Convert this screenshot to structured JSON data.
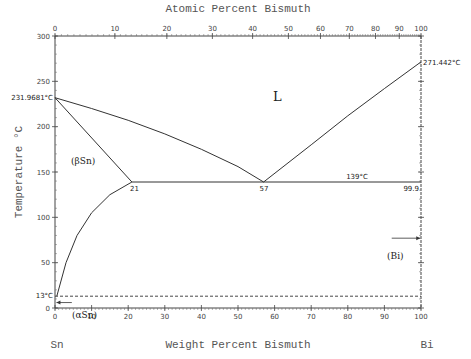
{
  "chart_data": {
    "type": "line",
    "title": "Atomic Percent Bismuth",
    "xlabel": "Weight Percent Bismuth",
    "ylabel": "Temperature °C",
    "xlim": [
      0,
      100
    ],
    "ylim": [
      0,
      300
    ],
    "x_ticks": [
      0,
      10,
      20,
      30,
      40,
      50,
      60,
      70,
      80,
      90,
      100
    ],
    "y_ticks": [
      0,
      50,
      100,
      150,
      200,
      250,
      300
    ],
    "top_axis_ticks": [
      0,
      10,
      20,
      30,
      40,
      50,
      60,
      70,
      80,
      90,
      100
    ],
    "grid": false,
    "component_left": "Sn",
    "component_right": "Bi",
    "series": [
      {
        "name": "liquidus Sn side",
        "x": [
          0,
          10,
          20,
          30,
          40,
          50,
          57
        ],
        "y": [
          231.9681,
          220,
          207,
          192,
          175,
          156,
          139
        ]
      },
      {
        "name": "liquidus Bi side",
        "x": [
          57,
          70,
          80,
          90,
          100
        ],
        "y": [
          139,
          180,
          212,
          242,
          271.442
        ]
      },
      {
        "name": "solidus (βSn)",
        "x": [
          0,
          21
        ],
        "y": [
          231.9681,
          139
        ]
      },
      {
        "name": "solvus (βSn)",
        "x": [
          0.5,
          3,
          6,
          10,
          15,
          21
        ],
        "y": [
          13,
          50,
          80,
          105,
          125,
          139
        ]
      },
      {
        "name": "eutectic line",
        "x": [
          21,
          99.9
        ],
        "y": [
          139,
          139
        ]
      },
      {
        "name": "αSn/βSn transition (dashed)",
        "x": [
          0,
          100
        ],
        "y": [
          13,
          13
        ]
      }
    ],
    "annotations": [
      {
        "text": "231.9681°C",
        "x": 0,
        "y": 231.9681
      },
      {
        "text": "271.442°C",
        "x": 100,
        "y": 271.442
      },
      {
        "text": "L",
        "x": 48,
        "y": 220
      },
      {
        "text": "(βSn)",
        "x": 7,
        "y": 140
      },
      {
        "text": "21",
        "x": 21,
        "y": 139
      },
      {
        "text": "57",
        "x": 57,
        "y": 139
      },
      {
        "text": "139°C",
        "x": 82,
        "y": 139
      },
      {
        "text": "99.9",
        "x": 99.9,
        "y": 139
      },
      {
        "text": "(Bi)",
        "x": 97,
        "y": 77
      },
      {
        "text": "13°C",
        "x": 0,
        "y": 13
      },
      {
        "text": "(αSn)",
        "x": 5,
        "y": 5
      }
    ]
  },
  "labels": {
    "top_title": "Atomic Percent Bismuth",
    "bottom_title": "Weight Percent Bismuth",
    "y_title": "Temperature °C",
    "left_elem": "Sn",
    "right_elem": "Bi",
    "L": "L",
    "beta_sn": "(βSn)",
    "alpha_sn": "(αSn)",
    "bi_phase": "(Bi)",
    "sn_melt": "231.9681°C",
    "bi_melt": "271.442°C",
    "eut_left": "21",
    "eut_mid": "57",
    "eut_temp": "139°C",
    "eut_right": "99.9",
    "trans_temp": "13°C"
  }
}
